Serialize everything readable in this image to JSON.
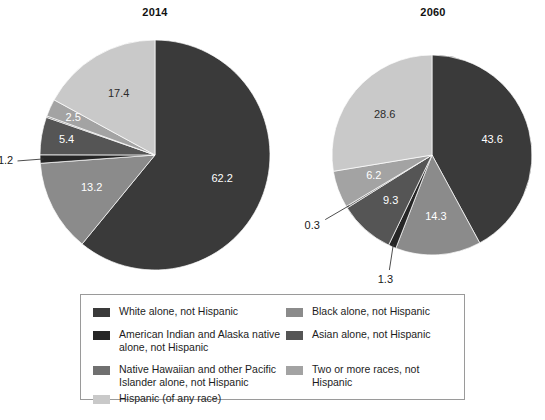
{
  "chart_data": {
    "type": "pie",
    "title": "",
    "charts": [
      {
        "title": "2014",
        "labels": [
          "White alone, not Hispanic",
          "Black alone, not Hispanic",
          "American Indian and Alaska native alone, not Hispanic",
          "Asian alone, not Hispanic",
          "Native Hawaiian and other Pacific Islander alone, not Hispanic",
          "Two or more races, not Hispanic",
          "Hispanic (of any race)"
        ],
        "values": [
          62.2,
          13.2,
          1.2,
          5.4,
          0.2,
          2.5,
          17.4
        ],
        "visible_value_labels": [
          "62.2",
          "13.2",
          "1.2",
          "5.4",
          "2.5",
          "17.4"
        ],
        "unit": "percent"
      },
      {
        "title": "2060",
        "labels": [
          "White alone, not Hispanic",
          "Black alone, not Hispanic",
          "American Indian and Alaska native alone, not Hispanic",
          "Asian alone, not Hispanic",
          "Native Hawaiian and other Pacific Islander alone, not Hispanic",
          "Two or more races, not Hispanic",
          "Hispanic (of any race)"
        ],
        "values": [
          43.6,
          14.3,
          1.3,
          9.3,
          0.3,
          6.2,
          28.6
        ],
        "visible_value_labels": [
          "43.6",
          "14.3",
          "1.3",
          "9.3",
          "0.3",
          "6.2",
          "28.6"
        ],
        "unit": "percent"
      }
    ],
    "legend_position": "bottom",
    "grid": false
  },
  "pie2014": {
    "title": "2014",
    "slices": [
      {
        "key": "white",
        "label": "62.2",
        "value": 62.2,
        "color": "#3a3a3a",
        "label_inside": true,
        "label_fill": "light"
      },
      {
        "key": "black",
        "label": "13.2",
        "value": 13.2,
        "color": "#8b8b8b",
        "label_inside": true,
        "label_fill": "light"
      },
      {
        "key": "amind",
        "label": "1.2",
        "value": 1.2,
        "color": "#262626",
        "label_inside": false,
        "label_fill": "dark"
      },
      {
        "key": "asian",
        "label": "5.4",
        "value": 5.4,
        "color": "#555555",
        "label_inside": true,
        "label_fill": "light"
      },
      {
        "key": "nhpi",
        "label": "",
        "value": 0.2,
        "color": "#707070",
        "label_inside": false,
        "label_fill": "dark"
      },
      {
        "key": "twoplus",
        "label": "2.5",
        "value": 2.5,
        "color": "#a3a3a3",
        "label_inside": true,
        "label_fill": "light"
      },
      {
        "key": "hispanic",
        "label": "17.4",
        "value": 17.4,
        "color": "#c9c9c9",
        "label_inside": true,
        "label_fill": "dark"
      }
    ]
  },
  "pie2060": {
    "title": "2060",
    "slices": [
      {
        "key": "white",
        "label": "43.6",
        "value": 43.6,
        "color": "#3a3a3a",
        "label_inside": true,
        "label_fill": "light"
      },
      {
        "key": "black",
        "label": "14.3",
        "value": 14.3,
        "color": "#8b8b8b",
        "label_inside": true,
        "label_fill": "light"
      },
      {
        "key": "amind",
        "label": "1.3",
        "value": 1.3,
        "color": "#262626",
        "label_inside": false,
        "label_fill": "dark"
      },
      {
        "key": "asian",
        "label": "9.3",
        "value": 9.3,
        "color": "#555555",
        "label_inside": true,
        "label_fill": "light"
      },
      {
        "key": "nhpi",
        "label": "0.3",
        "value": 0.3,
        "color": "#707070",
        "label_inside": false,
        "label_fill": "dark"
      },
      {
        "key": "twoplus",
        "label": "6.2",
        "value": 6.2,
        "color": "#a3a3a3",
        "label_inside": true,
        "label_fill": "light"
      },
      {
        "key": "hispanic",
        "label": "28.6",
        "value": 28.6,
        "color": "#c9c9c9",
        "label_inside": true,
        "label_fill": "dark"
      }
    ]
  },
  "legend": {
    "items": [
      {
        "key": "white",
        "label": "White alone, not Hispanic",
        "color": "#3a3a3a"
      },
      {
        "key": "black",
        "label": "Black alone, not Hispanic",
        "color": "#8b8b8b"
      },
      {
        "key": "amind",
        "label": "American Indian and Alaska native\nalone, not Hispanic",
        "color": "#262626"
      },
      {
        "key": "asian",
        "label": "Asian alone, not Hispanic",
        "color": "#555555"
      },
      {
        "key": "nhpi",
        "label": "Native Hawaiian and other Pacific\nIslander alone, not Hispanic",
        "color": "#707070"
      },
      {
        "key": "twoplus",
        "label": "Two or more races, not Hispanic",
        "color": "#a3a3a3"
      },
      {
        "key": "hispanic",
        "label": "Hispanic (of any race)",
        "color": "#c9c9c9"
      }
    ]
  }
}
